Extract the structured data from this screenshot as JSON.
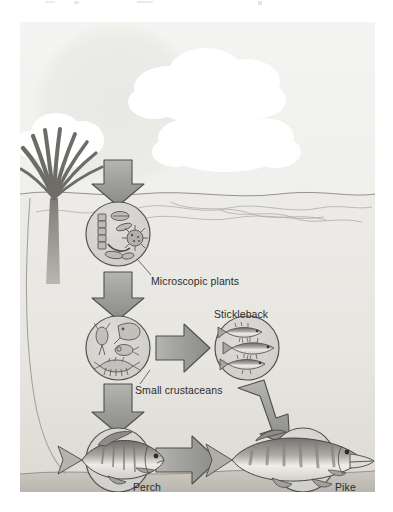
{
  "illustration": {
    "title": "Aquatic food chain",
    "medium": "grayscale textbook diagram",
    "background_color": "#ffffff"
  },
  "scene": {
    "sky": {
      "name": "sky",
      "color": "#f2f2f0",
      "sun": {
        "name": "sun",
        "color": "#ececea"
      },
      "clouds": [
        {
          "name": "cloud-upper-right",
          "color": "#ffffff"
        },
        {
          "name": "cloud-lower-right",
          "color": "#ffffff"
        },
        {
          "name": "cloud-left-small",
          "color": "#ffffff"
        }
      ]
    },
    "water": {
      "name": "lake-water",
      "surface_color": "#e4e3e0",
      "body_color": "#eceae6",
      "bed_color": "#c9c6c0",
      "ripples": 4
    },
    "plant": {
      "name": "reed-plant",
      "color": "#8f8f8a",
      "blades": 9
    }
  },
  "nodes": [
    {
      "id": "microscopic-plants",
      "label": "Microscopic plants",
      "circle_fill": "#d8d6d2",
      "circle_stroke": "#55534f",
      "contents": "diatoms and algae",
      "cx": 98,
      "cy": 212,
      "r": 32
    },
    {
      "id": "small-crustaceans",
      "label": "Small crustaceans",
      "circle_fill": "#d8d6d2",
      "circle_stroke": "#55534f",
      "contents": "copepods, water fleas, shrimp",
      "cx": 98,
      "cy": 326,
      "r": 32
    },
    {
      "id": "stickleback",
      "label": "Stickleback",
      "circle_fill": "#d8d6d2",
      "circle_stroke": "#55534f",
      "contents": "three stickleback fish",
      "cx": 227,
      "cy": 326,
      "r": 32
    },
    {
      "id": "perch",
      "label": "Perch",
      "circle_fill": "#d8d6d2",
      "circle_stroke": "#55534f",
      "contents": "one perch fish",
      "cx": 98,
      "cy": 438,
      "r": 32
    },
    {
      "id": "pike",
      "label": "Pike",
      "circle_fill": "#d8d6d2",
      "circle_stroke": "#55534f",
      "contents": "one pike fish",
      "cx": 283,
      "cy": 438,
      "r": 32
    }
  ],
  "arrows": [
    {
      "id": "arrow-sun-to-plants",
      "from": "sunlight",
      "to": "microscopic-plants",
      "direction": "down",
      "fill": "#9a9a96",
      "stroke": "#4f4f4b"
    },
    {
      "id": "arrow-plants-to-crustaceans",
      "from": "microscopic-plants",
      "to": "small-crustaceans",
      "direction": "down",
      "fill": "#9a9a96",
      "stroke": "#4f4f4b"
    },
    {
      "id": "arrow-crustaceans-to-stickleback",
      "from": "small-crustaceans",
      "to": "stickleback",
      "direction": "right",
      "fill": "#9a9a96",
      "stroke": "#4f4f4b"
    },
    {
      "id": "arrow-crustaceans-to-perch",
      "from": "small-crustaceans",
      "to": "perch",
      "direction": "down",
      "fill": "#9a9a96",
      "stroke": "#4f4f4b"
    },
    {
      "id": "arrow-stickleback-to-pike",
      "from": "stickleback",
      "to": "pike",
      "direction": "down-right",
      "fill": "#9a9a96",
      "stroke": "#4f4f4b"
    },
    {
      "id": "arrow-perch-to-pike",
      "from": "perch",
      "to": "pike",
      "direction": "right",
      "fill": "#9a9a96",
      "stroke": "#4f4f4b"
    }
  ],
  "leaders": [
    {
      "id": "leader-microscopic-plants",
      "to_label": "Microscopic plants",
      "color": "#55534f"
    },
    {
      "id": "leader-small-crustaceans",
      "to_label": "Small crustaceans",
      "color": "#55534f"
    }
  ]
}
